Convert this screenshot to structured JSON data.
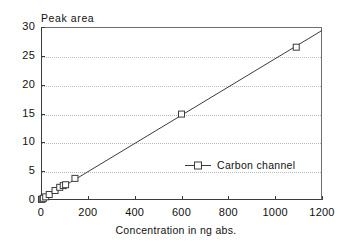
{
  "chart_data": {
    "type": "scatter",
    "title": "",
    "xlabel": "Concentration in ng abs.",
    "ylabel": "Peak area",
    "xlim": [
      0,
      1200
    ],
    "ylim": [
      0,
      30
    ],
    "xticks": [
      0,
      200,
      400,
      600,
      800,
      1000,
      1200
    ],
    "yticks": [
      0,
      5,
      10,
      15,
      20,
      25,
      30
    ],
    "xtick_labels": [
      "0",
      "200",
      "400",
      "600",
      "800",
      "1000",
      "1200"
    ],
    "ytick_labels": [
      "0",
      "5",
      "10",
      "15",
      "20",
      "25",
      "30"
    ],
    "grid": "horizontal-dotted",
    "legend_position": "inside-center-right",
    "series": [
      {
        "name": "Carbon channel",
        "marker": "open-square",
        "line": "solid",
        "color": "#3b3b3b",
        "x": [
          2,
          5,
          10,
          20,
          35,
          60,
          80,
          95,
          105,
          145,
          600,
          1090
        ],
        "y": [
          0.1,
          0.15,
          0.3,
          0.55,
          0.95,
          1.65,
          2.2,
          2.5,
          2.65,
          3.75,
          14.9,
          26.5
        ]
      }
    ],
    "fit_line": {
      "x": [
        0,
        1200
      ],
      "y": [
        0.0,
        29.4
      ]
    }
  },
  "legend": {
    "entries": [
      {
        "label": "Carbon channel"
      }
    ]
  },
  "axes": {
    "y_title": "Peak area",
    "x_title": "Concentration in ng abs."
  }
}
